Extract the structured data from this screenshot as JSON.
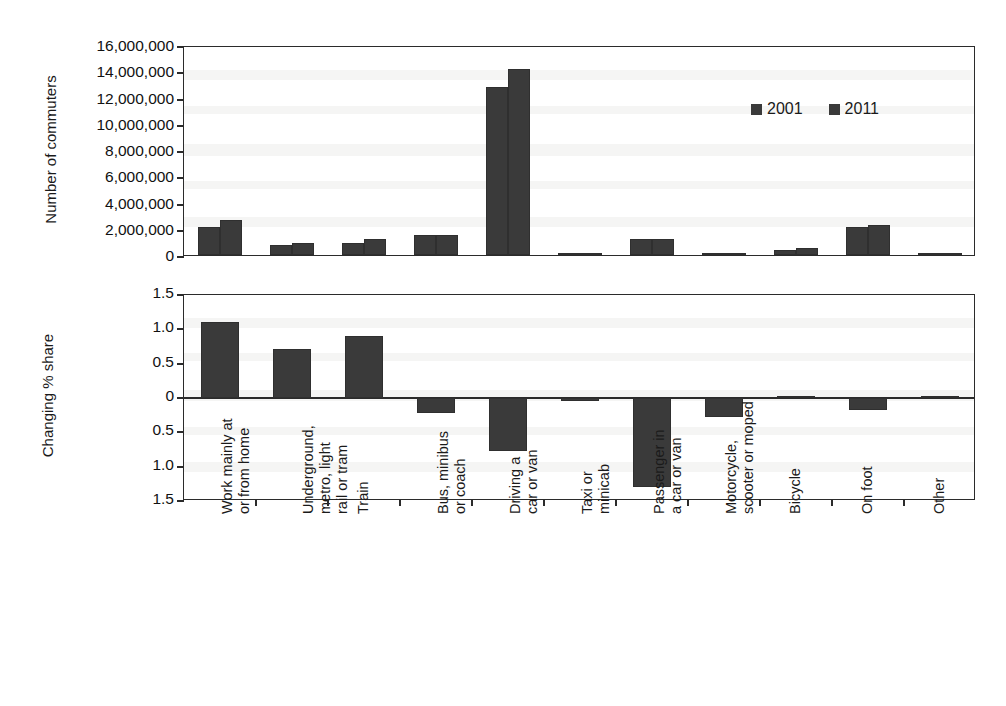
{
  "chart_data": [
    {
      "id": "top",
      "type": "bar",
      "title": "",
      "xlabel": "",
      "ylabel": "Number of commuters",
      "ylim": [
        0,
        16000000
      ],
      "ytick_labels": [
        "16,000,000",
        "14,000,000",
        "12,000,000",
        "10,000,000",
        "8,000,000",
        "6,000,000",
        "4,000,000",
        "2,000,000",
        "0"
      ],
      "ytick_values": [
        16000000,
        14000000,
        12000000,
        10000000,
        8000000,
        6000000,
        4000000,
        2000000,
        0
      ],
      "grid": false,
      "legend_position": "top-right",
      "categories": [
        "Work mainly at or from home",
        "Underground, metro, light rail or tram",
        "Train",
        "Bus, minibus or coach",
        "Driving a car or van",
        "Taxi or minicab",
        "Passenger in a car or van",
        "Motorcycle, scooter or moped",
        "Bicycle",
        "On foot",
        "Other"
      ],
      "series": [
        {
          "name": "2001",
          "values": [
            2100000,
            750000,
            950000,
            1550000,
            12800000,
            110000,
            1200000,
            150000,
            400000,
            2100000,
            100000
          ]
        },
        {
          "name": "2011",
          "values": [
            2700000,
            950000,
            1250000,
            1550000,
            14200000,
            130000,
            1200000,
            150000,
            550000,
            2300000,
            100000
          ]
        }
      ]
    },
    {
      "id": "bottom",
      "type": "bar",
      "title": "",
      "xlabel": "",
      "ylabel": "Changing % share",
      "ylim": [
        -1.5,
        1.5
      ],
      "ytick_labels": [
        "1.5",
        "1.0",
        "0.5",
        "0",
        "0.5",
        "1.0",
        "1.5"
      ],
      "ytick_values": [
        1.5,
        1.0,
        0.5,
        0,
        -0.5,
        -1.0,
        -1.5
      ],
      "grid": false,
      "legend_position": "none",
      "categories": [
        "Work mainly at or from home",
        "Underground, metro, light rail or tram",
        "Train",
        "Bus, minibus or coach",
        "Driving a car or van",
        "Taxi or minicab",
        "Passenger in a car or van",
        "Motorcycle, scooter or moped",
        "Bicycle",
        "On foot",
        "Other"
      ],
      "series": [
        {
          "name": "Changing % share",
          "values": [
            1.1,
            0.72,
            0.9,
            -0.22,
            -0.77,
            -0.03,
            -1.3,
            -0.28,
            0.02,
            -0.18,
            0.02
          ]
        }
      ]
    }
  ],
  "legend": {
    "items": [
      {
        "label": "2001",
        "color": "#3a3a3a"
      },
      {
        "label": "2011",
        "color": "#3a3a3a"
      }
    ]
  },
  "axes": {
    "top": {
      "ylabel": "Number of commuters",
      "ticks": [
        "16,000,000",
        "14,000,000",
        "12,000,000",
        "10,000,000",
        "8,000,000",
        "6,000,000",
        "4,000,000",
        "2,000,000",
        "0"
      ]
    },
    "bottom": {
      "ylabel": "Changing % share",
      "ticks": [
        "1.5",
        "1.0",
        "0.5",
        "0",
        "0.5",
        "1.0",
        "1.5"
      ]
    }
  },
  "categories": [
    {
      "lines": [
        "Work mainly at",
        "or from home"
      ]
    },
    {
      "lines": [
        "Underground,",
        "metro, light",
        "rail or tram"
      ]
    },
    {
      "lines": [
        "Train"
      ]
    },
    {
      "lines": [
        "Bus, minibus",
        "or coach"
      ]
    },
    {
      "lines": [
        "Driving a",
        "car or van"
      ]
    },
    {
      "lines": [
        "Taxi or",
        "minicab"
      ]
    },
    {
      "lines": [
        "Passenger in",
        "a car or van"
      ]
    },
    {
      "lines": [
        "Motorcycle,",
        "scooter or moped"
      ]
    },
    {
      "lines": [
        "Bicycle"
      ]
    },
    {
      "lines": [
        "On foot"
      ]
    },
    {
      "lines": [
        "Other"
      ]
    }
  ],
  "colors": {
    "bar": "#3a3a3a",
    "axis": "#2b2b2b",
    "background": "#ffffff"
  }
}
